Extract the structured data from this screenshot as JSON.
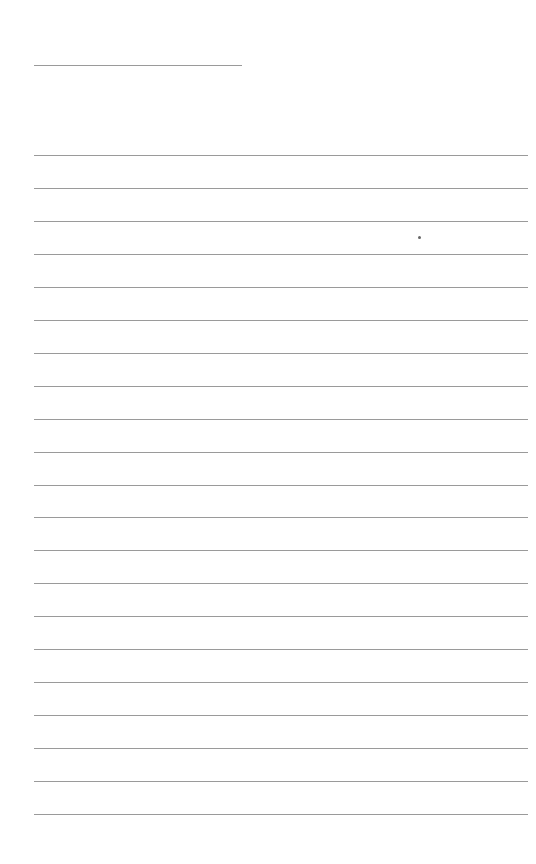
{
  "document": {
    "type": "lined-paper",
    "background": "#ffffff",
    "line_color": "#9a9a9a",
    "header_line": {
      "x": 34,
      "y": 65,
      "width": 208
    },
    "rules": {
      "count": 21,
      "first_y": 155,
      "spacing": 32.95,
      "x": 34,
      "width": 494
    },
    "mark": {
      "x": 419,
      "y": 237
    }
  }
}
